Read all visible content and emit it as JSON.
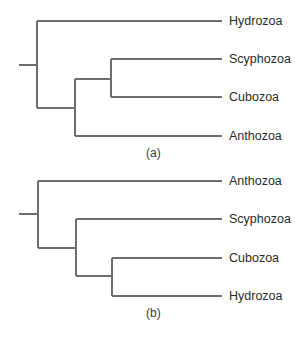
{
  "trees": [
    {
      "caption": "(a)",
      "taxa": [
        "Hydrozoa",
        "Scyphozoa",
        "Cubozoa",
        "Anthozoa"
      ],
      "topology": "(Hydrozoa,((Scyphozoa,Cubozoa),Anthozoa))"
    },
    {
      "caption": "(b)",
      "taxa": [
        "Anthozoa",
        "Scyphozoa",
        "Cubozoa",
        "Hydrozoa"
      ],
      "topology": "(Anthozoa,(Scyphozoa,(Cubozoa,Hydrozoa)))"
    }
  ],
  "colors": {
    "branch": "#6e6e6e",
    "label": "#2a2a2a",
    "background": "#ffffff"
  }
}
